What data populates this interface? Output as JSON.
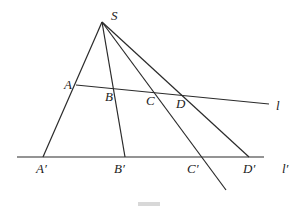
{
  "diagram": {
    "type": "projective-perspectivity",
    "points": {
      "S": {
        "label": "S",
        "x": 102,
        "y": 22,
        "lx": 111,
        "ly": 20
      },
      "A": {
        "label": "A",
        "x": 76,
        "y": 85,
        "lx": 64,
        "ly": 89
      },
      "B": {
        "label": "B",
        "x": 114,
        "y": 89,
        "lx": 105,
        "ly": 101
      },
      "C": {
        "label": "C",
        "x": 154,
        "y": 93,
        "lx": 146,
        "ly": 105
      },
      "D": {
        "label": "D",
        "x": 181,
        "y": 96,
        "lx": 176,
        "ly": 108
      },
      "A1": {
        "label": "A′",
        "x": 43,
        "y": 157,
        "lx": 36,
        "ly": 173
      },
      "B1": {
        "label": "B′",
        "x": 125,
        "y": 157,
        "lx": 114,
        "ly": 173
      },
      "C1": {
        "label": "C′",
        "x": 202,
        "y": 157,
        "lx": 187,
        "ly": 173
      },
      "D1": {
        "label": "D′",
        "x": 249,
        "y": 157,
        "lx": 243,
        "ly": 173
      }
    },
    "lines": {
      "l": {
        "label": "l",
        "x1": 76,
        "y1": 85,
        "x2": 269,
        "y2": 104,
        "lx": 276,
        "ly": 110
      },
      "l_prime": {
        "label": "l′",
        "x1": 17,
        "y1": 157,
        "x2": 264,
        "y2": 157,
        "lx": 282,
        "ly": 173
      }
    },
    "rays": [
      {
        "from": "S",
        "to": "A1"
      },
      {
        "from": "S",
        "to": "B1"
      },
      {
        "from": "S",
        "to": "C1",
        "extend_to": {
          "x": 226,
          "y": 190
        }
      },
      {
        "from": "S",
        "to": "D1"
      }
    ],
    "caption": "图"
  }
}
